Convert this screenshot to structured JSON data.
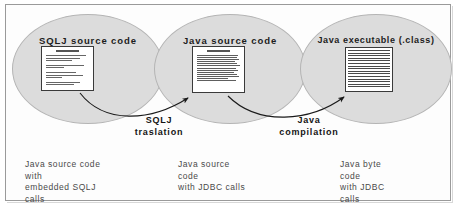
{
  "diagram": {
    "stages": [
      {
        "id": "sqlj-source",
        "label": "SQLJ source code",
        "thumbnail": "text-document-sparse",
        "caption": [
          "Java source code",
          "with",
          "embedded SQLJ",
          "calls"
        ]
      },
      {
        "id": "java-source",
        "label": "Java source code",
        "thumbnail": "text-document-dense",
        "caption": [
          "Java source",
          "code",
          "with JDBC calls"
        ]
      },
      {
        "id": "java-executable",
        "label": "Java executable (.class)",
        "thumbnail": "bytecode-hatch-grid",
        "caption": [
          "Java byte",
          "code",
          "with JDBC",
          "calls"
        ]
      }
    ],
    "transitions": [
      {
        "id": "sqlj-translation",
        "from": "sqlj-source",
        "to": "java-source",
        "line1": "SQLJ",
        "line2": "traslation"
      },
      {
        "id": "java-compilation",
        "from": "java-source",
        "to": "java-executable",
        "line1": "Java",
        "line2": "compilation"
      }
    ]
  },
  "colors": {
    "ellipse_fill": "#dcdcdc",
    "ellipse_stroke": "#b4b4b4",
    "page_background": "#ffffff",
    "frame_border": "#9a9a9a",
    "label_text": "#1d1d1d",
    "caption_text": "#4a4a4a",
    "arrow_stroke": "#1a1a1a",
    "document_border": "#3a3a3a"
  }
}
